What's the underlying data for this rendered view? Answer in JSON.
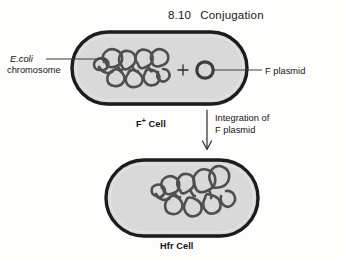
{
  "figure": {
    "number": "8.10",
    "title": "Conjugation"
  },
  "labels": {
    "ecoli": "E.coli",
    "chromosome": "chromosome",
    "f_plasmid": "F plasmid",
    "f_plus_cell_text": "F",
    "f_plus_cell_sup": "+",
    "f_plus_cell_suffix": " Cell",
    "hfr_cell": "Hfr Cell",
    "integration_line1": "Integration of",
    "integration_line2": "F plasmid",
    "plus_sign": "+"
  },
  "colors": {
    "page_background": "#fdfdfc",
    "cell_fill": "#d9d9d9",
    "cell_border": "#1c1c1c",
    "chromosome_stroke": "#4a4a4a",
    "leader_line": "#3a3a3a",
    "text": "#151515"
  },
  "diagram": {
    "type": "biology-process-diagram",
    "steps": [
      {
        "name": "f-plus-cell",
        "label": "F+ Cell",
        "contents": [
          "E.coli chromosome",
          "F plasmid"
        ]
      },
      {
        "name": "hfr-cell",
        "label": "Hfr Cell",
        "contents": [
          "E.coli chromosome with integrated F plasmid"
        ]
      }
    ],
    "transition": "Integration of F plasmid"
  }
}
